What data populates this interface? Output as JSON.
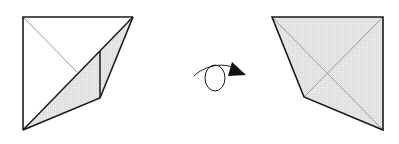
{
  "diagram": {
    "type": "origami-fold-step",
    "colors": {
      "line": "#1a1a1a",
      "crease": "#9a9a9a",
      "fill_shaded": "#e6e6e6",
      "background": "#ffffff"
    },
    "left_figure": {
      "description": "Square with lower-right corner folded along diagonal, showing shaded flap",
      "shape": "square-with-fold"
    },
    "action": {
      "symbol": "turn-over-arrow",
      "meaning": "Turn the model over"
    },
    "right_figure": {
      "description": "Flipped model, shaded quadrilateral with diagonal creases",
      "shape": "shaded-quadrilateral"
    }
  }
}
